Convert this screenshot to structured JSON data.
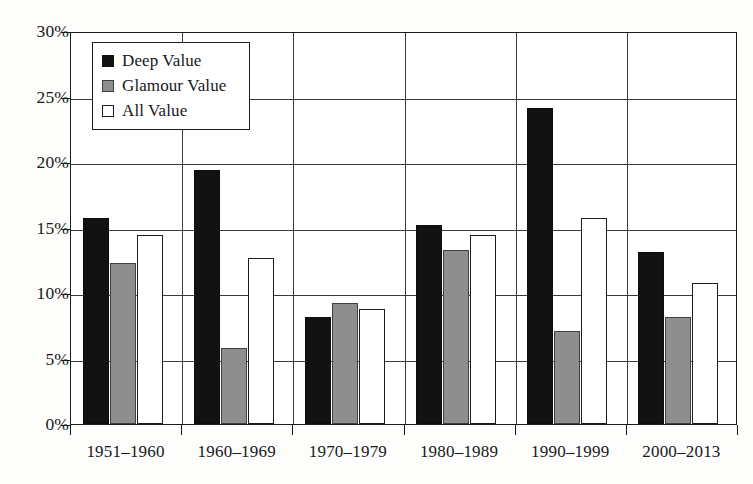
{
  "chart_data": {
    "type": "bar",
    "title": "",
    "subtitle": "",
    "xlabel": "",
    "ylabel": "",
    "ylim": [
      0,
      30
    ],
    "ytick_values": [
      0,
      5,
      10,
      15,
      20,
      25,
      30
    ],
    "ytick_labels": [
      "0%",
      "5%",
      "10%",
      "15%",
      "20%",
      "25%",
      "30%"
    ],
    "grid": true,
    "value_unit": "percent",
    "legend_position": "top-left inside plot",
    "categories": [
      "1951–1960",
      "1960–1969",
      "1970–1979",
      "1980–1989",
      "1990–1999",
      "2000–2013"
    ],
    "series": [
      {
        "name": "Deep Value",
        "color": "#121212",
        "fill": "solid-black",
        "values": [
          15.7,
          19.4,
          8.2,
          15.2,
          24.1,
          13.1
        ]
      },
      {
        "name": "Glamour Value",
        "color": "#8e8e8e",
        "fill": "solid-gray",
        "values": [
          12.3,
          5.8,
          9.2,
          13.3,
          7.1,
          8.2
        ]
      },
      {
        "name": "All Value",
        "color": "#ffffff",
        "fill": "white-outlined",
        "values": [
          14.4,
          12.7,
          8.8,
          14.4,
          15.7,
          10.8
        ]
      }
    ]
  },
  "legend": {
    "items": [
      {
        "label": "Deep Value",
        "swatch": "filled-black-square-icon"
      },
      {
        "label": "Glamour Value",
        "swatch": "filled-gray-square-icon"
      },
      {
        "label": "All Value",
        "swatch": "outlined-white-square-icon"
      }
    ]
  },
  "axes": {
    "y_labels": [
      "30%",
      "25%",
      "20%",
      "15%",
      "10%",
      "5%",
      "0%"
    ],
    "x_labels": [
      "1951–1960",
      "1960–1969",
      "1970–1979",
      "1980–1989",
      "1990–1999",
      "2000–2013"
    ]
  }
}
